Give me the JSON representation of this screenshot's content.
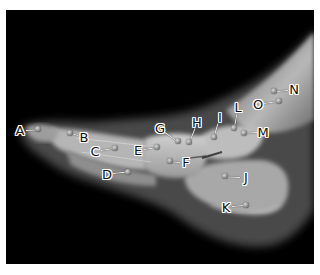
{
  "image": {
    "description": "Lateral radiograph of a foot with lettered anatomical markers",
    "background_color": "#000000",
    "border_color": "#ffffff"
  },
  "markers": [
    {
      "id": "A",
      "label": "A",
      "label_x": 20,
      "label_y": 130,
      "dot_x": 38,
      "dot_y": 129
    },
    {
      "id": "B",
      "label": "B",
      "label_x": 84,
      "label_y": 137,
      "dot_x": 70,
      "dot_y": 133
    },
    {
      "id": "C",
      "label": "C",
      "label_x": 95,
      "label_y": 151,
      "dot_x": 115,
      "dot_y": 148
    },
    {
      "id": "D",
      "label": "D",
      "label_x": 107,
      "label_y": 174,
      "dot_x": 128,
      "dot_y": 172
    },
    {
      "id": "E",
      "label": "E",
      "label_x": 138,
      "label_y": 150,
      "dot_x": 157,
      "dot_y": 147
    },
    {
      "id": "F",
      "label": "F",
      "label_x": 186,
      "label_y": 162,
      "dot_x": 170,
      "dot_y": 161
    },
    {
      "id": "G",
      "label": "G",
      "label_x": 160,
      "label_y": 128,
      "dot_x": 178,
      "dot_y": 141
    },
    {
      "id": "H",
      "label": "H",
      "label_x": 197,
      "label_y": 122,
      "dot_x": 189,
      "dot_y": 142
    },
    {
      "id": "I",
      "label": "I",
      "label_x": 220,
      "label_y": 117,
      "dot_x": 214,
      "dot_y": 137
    },
    {
      "id": "J",
      "label": "J",
      "label_x": 246,
      "label_y": 177,
      "dot_x": 225,
      "dot_y": 176
    },
    {
      "id": "K",
      "label": "K",
      "label_x": 226,
      "label_y": 207,
      "dot_x": 246,
      "dot_y": 205
    },
    {
      "id": "L",
      "label": "L",
      "label_x": 238,
      "label_y": 107,
      "dot_x": 234,
      "dot_y": 128
    },
    {
      "id": "M",
      "label": "M",
      "label_x": 263,
      "label_y": 132,
      "dot_x": 244,
      "dot_y": 133
    },
    {
      "id": "N",
      "label": "N",
      "label_x": 294,
      "label_y": 89,
      "dot_x": 274,
      "dot_y": 91
    },
    {
      "id": "O",
      "label": "O",
      "label_x": 258,
      "label_y": 104,
      "dot_x": 279,
      "dot_y": 101
    }
  ]
}
